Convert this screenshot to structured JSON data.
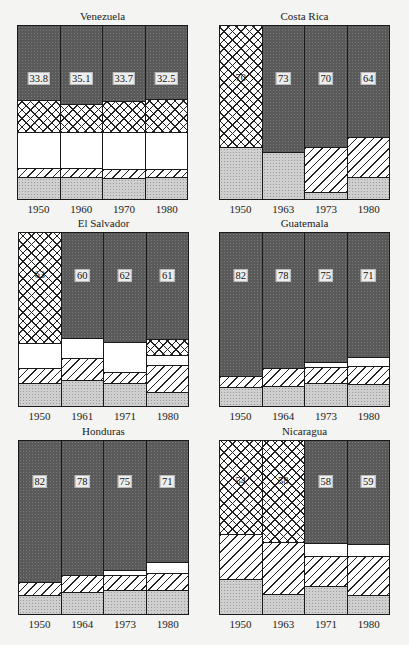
{
  "chart_data": [
    {
      "type": "bar",
      "stacked": true,
      "title": "Venezuela",
      "categories": [
        "1950",
        "1960",
        "1970",
        "1980"
      ],
      "value_labels": [
        "33.8",
        "35.1",
        "33.7",
        "32.5"
      ],
      "segment_order_bottom_up": [
        "light",
        "hatch",
        "white",
        "cross",
        "dark"
      ],
      "segments_pct": [
        [
          12.6,
          5.1,
          21.1,
          18.3,
          42.9
        ],
        [
          12.6,
          5.1,
          21.1,
          16.0,
          45.2
        ],
        [
          12.0,
          5.1,
          21.7,
          17.7,
          43.5
        ],
        [
          12.6,
          4.6,
          21.7,
          18.9,
          42.2
        ]
      ],
      "ylim": [
        0,
        100
      ]
    },
    {
      "type": "bar",
      "stacked": true,
      "title": "Costa Rica",
      "categories": [
        "1950",
        "1963",
        "1973",
        "1980"
      ],
      "value_labels": [
        "70",
        "73",
        "70",
        "64"
      ],
      "segment_order_bottom_up": [
        "light",
        "hatch",
        "white",
        "cross",
        "dark"
      ],
      "segments_pct": [
        [
          30.3,
          0,
          0,
          69.7,
          0
        ],
        [
          27.4,
          0,
          0,
          0,
          72.6
        ],
        [
          4.0,
          26.3,
          0,
          0,
          69.7
        ],
        [
          12.6,
          23.4,
          0,
          0,
          64.0
        ]
      ],
      "ylim": [
        0,
        100
      ]
    },
    {
      "type": "bar",
      "stacked": true,
      "title": "El Salvador",
      "categories": [
        "1950",
        "1961",
        "1971",
        "1980"
      ],
      "value_labels": [
        "63",
        "60",
        "62",
        "61"
      ],
      "segment_order_bottom_up": [
        "light",
        "hatch",
        "white",
        "cross",
        "dark"
      ],
      "segments_pct": [
        [
          13.2,
          8.6,
          14.4,
          63.8,
          0
        ],
        [
          14.9,
          12.6,
          12.1,
          0,
          60.4
        ],
        [
          13.2,
          6.3,
          17.8,
          0,
          62.7
        ],
        [
          8.0,
          15.5,
          5.8,
          9.2,
          61.5
        ]
      ],
      "ylim": [
        0,
        100
      ]
    },
    {
      "type": "bar",
      "stacked": true,
      "title": "Guatemala",
      "categories": [
        "1950",
        "1964",
        "1973",
        "1980"
      ],
      "value_labels": [
        "82",
        "78",
        "75",
        "71"
      ],
      "segment_order_bottom_up": [
        "light",
        "hatch",
        "white",
        "cross",
        "dark"
      ],
      "segments_pct": [
        [
          10.9,
          6.3,
          0,
          0,
          82.8
        ],
        [
          11.5,
          10.3,
          0,
          0,
          78.2
        ],
        [
          13.2,
          9.2,
          2.9,
          0,
          74.7
        ],
        [
          12.6,
          10.3,
          5.7,
          0,
          71.4
        ]
      ],
      "ylim": [
        0,
        100
      ]
    },
    {
      "type": "bar",
      "stacked": true,
      "title": "Honduras",
      "categories": [
        "1950",
        "1964",
        "1973",
        "1980"
      ],
      "value_labels": [
        "82",
        "78",
        "75",
        "71"
      ],
      "segment_order_bottom_up": [
        "light",
        "hatch",
        "white",
        "cross",
        "dark"
      ],
      "segments_pct": [
        [
          10.9,
          7.5,
          0,
          0,
          81.6
        ],
        [
          12.6,
          9.8,
          0,
          0,
          77.6
        ],
        [
          13.8,
          8.6,
          2.9,
          0,
          74.7
        ],
        [
          13.8,
          9.8,
          6.3,
          0,
          70.1
        ]
      ],
      "ylim": [
        0,
        100
      ]
    },
    {
      "type": "bar",
      "stacked": true,
      "title": "Nicaragua",
      "categories": [
        "1950",
        "1963",
        "1971",
        "1980"
      ],
      "value_labels": [
        "54",
        "58",
        "58",
        "59"
      ],
      "segment_order_bottom_up": [
        "light",
        "hatch",
        "white",
        "cross",
        "dark"
      ],
      "segments_pct": [
        [
          20.2,
          26.0,
          0,
          53.8,
          0
        ],
        [
          11.6,
          30.0,
          0,
          58.4,
          0
        ],
        [
          16.2,
          17.3,
          7.5,
          0,
          59.0
        ],
        [
          11.0,
          22.5,
          6.9,
          0,
          59.6
        ]
      ],
      "ylim": [
        0,
        100
      ]
    }
  ],
  "panels": [
    {
      "title": "Venezuela",
      "x": 17,
      "y": 25,
      "years": [
        "1950",
        "1960",
        "1970",
        "1980"
      ],
      "labels": [
        "33.8",
        "35.1",
        "33.7",
        "32.5"
      ],
      "label_top": 46
    },
    {
      "title": "Costa Rica",
      "x": 219,
      "y": 25,
      "years": [
        "1950",
        "1963",
        "1973",
        "1980"
      ],
      "labels": [
        "70",
        "73",
        "70",
        "64"
      ],
      "label_top": 46
    },
    {
      "title": "El Salvador",
      "x": 18,
      "y": 232,
      "years": [
        "1950",
        "1961",
        "1971",
        "1980"
      ],
      "labels": [
        "63",
        "60",
        "62",
        "61"
      ],
      "label_top": 36
    },
    {
      "title": "Guatemala",
      "x": 219,
      "y": 232,
      "years": [
        "1950",
        "1964",
        "1973",
        "1980"
      ],
      "labels": [
        "82",
        "78",
        "75",
        "71"
      ],
      "label_top": 36
    },
    {
      "title": "Honduras",
      "x": 18,
      "y": 440,
      "years": [
        "1950",
        "1964",
        "1973",
        "1980"
      ],
      "labels": [
        "82",
        "78",
        "75",
        "71"
      ],
      "label_top": 34
    },
    {
      "title": "Nicaragua",
      "x": 219,
      "y": 440,
      "years": [
        "1950",
        "1963",
        "1971",
        "1980"
      ],
      "labels": [
        "54",
        "58",
        "58",
        "59"
      ],
      "label_top": 34
    }
  ],
  "segment_colors": {
    "light": "#cfcfcf",
    "hatch": "#ffffff",
    "white": "#ffffff",
    "cross": "#ffffff",
    "dark": "#5a5a5a"
  }
}
